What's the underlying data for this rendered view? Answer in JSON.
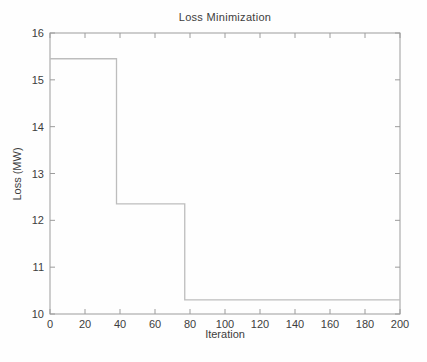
{
  "figure": {
    "title": "Loss Minimization",
    "xlabel": "Iteration",
    "ylabel": "Loss (MW)"
  },
  "chart_data": {
    "type": "line",
    "subtype": "step",
    "title": "Loss Minimization",
    "xlabel": "Iteration",
    "ylabel": "Loss (MW)",
    "xlim": [
      0,
      200
    ],
    "ylim": [
      10,
      16
    ],
    "xticks": [
      0,
      20,
      40,
      60,
      80,
      100,
      120,
      140,
      160,
      180,
      200
    ],
    "yticks": [
      10,
      11,
      12,
      13,
      14,
      15,
      16
    ],
    "grid": false,
    "legend": "none",
    "box": true,
    "series": [
      {
        "name": "loss",
        "points": [
          {
            "x": 0,
            "y": 15.45
          },
          {
            "x": 38,
            "y": 15.45
          },
          {
            "x": 38,
            "y": 12.35
          },
          {
            "x": 77,
            "y": 12.35
          },
          {
            "x": 77,
            "y": 10.3
          },
          {
            "x": 200,
            "y": 10.3
          }
        ]
      }
    ],
    "colors": {
      "line": "#bdbdbd",
      "axis": "#9c9c9c",
      "text": "#3d3d3d",
      "background": "#fefefe"
    }
  }
}
